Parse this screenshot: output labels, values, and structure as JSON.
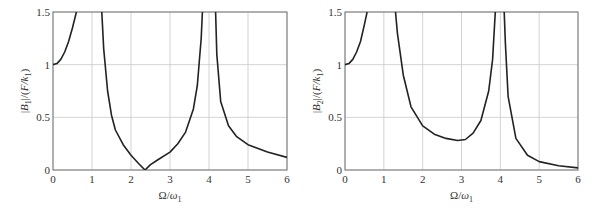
{
  "chart_data": [
    {
      "type": "line",
      "title": "",
      "xlabel": "Ω/ω1",
      "ylabel": "|B1|/(F/k1)",
      "xlim": [
        0,
        6
      ],
      "ylim": [
        0,
        1.5
      ],
      "xticks": [
        "0",
        "1",
        "2",
        "3",
        "4",
        "5",
        "6"
      ],
      "yticks": [
        "0",
        "0.5",
        "1",
        "1.5"
      ],
      "grid": true,
      "series": [
        {
          "name": "|B1|/(F/k1)",
          "x": [
            0,
            0.1,
            0.2,
            0.3,
            0.4,
            0.5,
            0.6,
            1.25,
            1.3,
            1.4,
            1.5,
            1.6,
            1.8,
            2.0,
            2.2,
            2.36,
            2.5,
            2.7,
            3.0,
            3.2,
            3.4,
            3.6,
            3.7,
            3.8,
            3.83,
            4.17,
            4.2,
            4.3,
            4.5,
            4.7,
            5.0,
            5.5,
            6.0
          ],
          "y": [
            1.0,
            1.01,
            1.05,
            1.12,
            1.22,
            1.35,
            1.5,
            1.5,
            1.15,
            0.75,
            0.52,
            0.38,
            0.24,
            0.14,
            0.06,
            0.0,
            0.05,
            0.1,
            0.17,
            0.25,
            0.36,
            0.58,
            0.8,
            1.25,
            1.5,
            1.5,
            1.1,
            0.65,
            0.42,
            0.32,
            0.24,
            0.17,
            0.12
          ]
        }
      ]
    },
    {
      "type": "line",
      "title": "",
      "xlabel": "Ω/ω1",
      "ylabel": "|B2|/(F/k1)",
      "xlim": [
        0,
        6
      ],
      "ylim": [
        0,
        1.5
      ],
      "xticks": [
        "0",
        "1",
        "2",
        "3",
        "4",
        "5",
        "6"
      ],
      "yticks": [
        "0",
        "0.5",
        "1",
        "1.5"
      ],
      "grid": true,
      "series": [
        {
          "name": "|B2|/(F/k1)",
          "x": [
            0,
            0.1,
            0.2,
            0.3,
            0.4,
            0.5,
            0.57,
            1.3,
            1.35,
            1.5,
            1.7,
            2.0,
            2.3,
            2.6,
            2.9,
            3.1,
            3.3,
            3.5,
            3.7,
            3.8,
            3.87,
            3.9,
            4.1,
            4.13,
            4.2,
            4.4,
            4.7,
            5.0,
            5.5,
            6.0
          ],
          "y": [
            1.0,
            1.01,
            1.05,
            1.12,
            1.22,
            1.38,
            1.5,
            1.5,
            1.3,
            0.9,
            0.6,
            0.42,
            0.34,
            0.3,
            0.28,
            0.29,
            0.35,
            0.47,
            0.75,
            1.05,
            1.5,
            1.5,
            1.5,
            1.2,
            0.7,
            0.3,
            0.14,
            0.08,
            0.04,
            0.02
          ]
        }
      ]
    }
  ],
  "charts": [
    {
      "ylabel_prefix": "|B",
      "ylabel_sub": "1",
      "ylabel_mid": "|/(F/k",
      "ylabel_sub2": "1",
      "ylabel_suffix": ")",
      "xlabel_main": "Ω/ω",
      "xlabel_sub": "1"
    },
    {
      "ylabel_prefix": "|B",
      "ylabel_sub": "2",
      "ylabel_mid": "|/(F/k",
      "ylabel_sub2": "1",
      "ylabel_suffix": ")",
      "xlabel_main": "Ω/ω",
      "xlabel_sub": "1"
    }
  ]
}
